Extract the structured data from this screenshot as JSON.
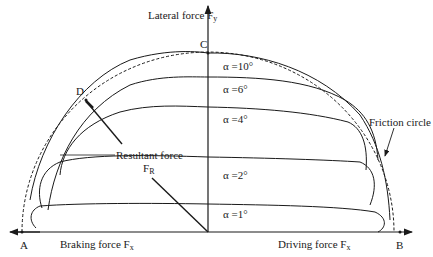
{
  "diagram": {
    "axes": {
      "vertical": {
        "label": "Lateral force F",
        "subscript": "y"
      },
      "horizontal_left": {
        "label": "Braking force F",
        "subscript": "x"
      },
      "horizontal_right": {
        "label": "Driving force F",
        "subscript": "x"
      }
    },
    "points": {
      "A": "A",
      "B": "B",
      "C": "C",
      "D": "D"
    },
    "resultant": {
      "label": "Resultant force",
      "symbol": "F",
      "subscript": "R"
    },
    "friction_circle": {
      "label": "Friction circle"
    },
    "curves": [
      {
        "label": "α =10°"
      },
      {
        "label": "α =6°"
      },
      {
        "label": "α =4°"
      },
      {
        "label": "α =2°"
      },
      {
        "label": "α =1°"
      }
    ],
    "colors": {
      "line": "#1a1a1a",
      "background": "#ffffff"
    }
  }
}
